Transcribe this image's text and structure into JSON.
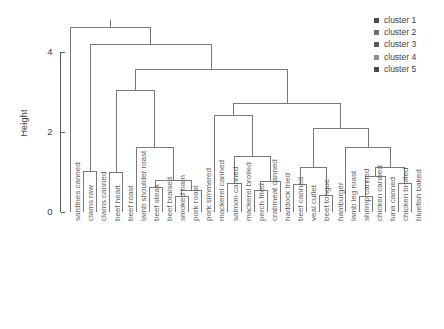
{
  "chart_data": {
    "type": "dendrogram",
    "title": "",
    "xlabel": "",
    "ylabel": "Height",
    "ylim": [
      0,
      4.8
    ],
    "yticks": [
      0,
      2,
      4
    ],
    "ytick_labels": [
      "0",
      "2",
      "4"
    ],
    "grid": false,
    "legend_position": "top-right",
    "leaf_order": [
      "sardines canned",
      "clams raw",
      "clams canned",
      "beef heart",
      "beef roast",
      "lamb shoulder roast",
      "beef steak",
      "beef braised",
      "smoked ham",
      "pork roast",
      "pork simmered",
      "mackerel canned",
      "salmon canned",
      "mackerel broiled",
      "perch fried",
      "crabmeat canned",
      "haddock fried",
      "beef canned",
      "veal cutlet",
      "beef tongue",
      "hamburger",
      "lamb leg roast",
      "shrimp canned",
      "chicken canned",
      "tuna canned",
      "chicken broiled",
      "bluefish baked"
    ],
    "merges": [
      {
        "id": "m1",
        "left": "clams raw",
        "right": "clams canned",
        "height": 1.02
      },
      {
        "id": "m2",
        "left": "beef steak",
        "right": "beef braised",
        "height": 0.62
      },
      {
        "id": "m3",
        "left": "smoked ham",
        "right": "pork roast",
        "height": 0.4
      },
      {
        "id": "m4",
        "left": "m3",
        "right": "pork simmered",
        "height": 0.55
      },
      {
        "id": "m5",
        "left": "m2",
        "right": "m4",
        "height": 0.8
      },
      {
        "id": "m6",
        "left": "lamb shoulder roast",
        "right": "m5",
        "height": 1.62
      },
      {
        "id": "m7",
        "left": "beef heart",
        "right": "beef roast",
        "height": 1.0
      },
      {
        "id": "m8",
        "left": "salmon canned",
        "right": "mackerel broiled",
        "height": 0.72
      },
      {
        "id": "m9",
        "left": "perch fried",
        "right": "crabmeat canned",
        "height": 0.56
      },
      {
        "id": "m10",
        "left": "m9",
        "right": "haddock fried",
        "height": 0.78
      },
      {
        "id": "m11",
        "left": "m8",
        "right": "m10",
        "height": 1.4
      },
      {
        "id": "m12",
        "left": "mackerel canned",
        "right": "m11",
        "height": 2.42
      },
      {
        "id": "m13",
        "left": "beef canned",
        "right": "veal cutlet",
        "height": 0.7
      },
      {
        "id": "m14",
        "left": "beef tongue",
        "right": "hamburger",
        "height": 0.42
      },
      {
        "id": "m15",
        "left": "m13",
        "right": "m14",
        "height": 1.12
      },
      {
        "id": "m16",
        "left": "shrimp canned",
        "right": "chicken canned",
        "height": 0.4
      },
      {
        "id": "m17",
        "left": "tuna canned",
        "right": "m16",
        "height": 0.9
      },
      {
        "id": "m18",
        "left": "chicken broiled",
        "right": "bluefish baked",
        "height": 0.72
      },
      {
        "id": "m19",
        "left": "m17",
        "right": "m18",
        "height": 1.12
      },
      {
        "id": "m20",
        "left": "lamb leg roast",
        "right": "m19",
        "height": 1.62
      },
      {
        "id": "m21",
        "left": "m15",
        "right": "m20",
        "height": 2.1
      },
      {
        "id": "m22",
        "left": "m12",
        "right": "m21",
        "height": 2.72
      },
      {
        "id": "m23",
        "left": "m7",
        "right": "m6",
        "height": 3.06
      },
      {
        "id": "m24",
        "left": "m23",
        "right": "m22",
        "height": 3.58
      },
      {
        "id": "m25",
        "left": "m1",
        "right": "m24",
        "height": 4.2
      },
      {
        "id": "m26",
        "left": "sardines canned",
        "right": "m25",
        "height": 4.62
      }
    ],
    "legend": [
      {
        "label": "cluster 1",
        "color": "#4d4d4d"
      },
      {
        "label": "cluster 2",
        "color": "#6e6e6e"
      },
      {
        "label": "cluster 3",
        "color": "#575757"
      },
      {
        "label": "cluster 4",
        "color": "#8d8d8d"
      },
      {
        "label": "cluster 5",
        "color": "#4a4a4a"
      }
    ],
    "line_color": "#7a7a7a",
    "axis_color": "#5a5a5a"
  }
}
